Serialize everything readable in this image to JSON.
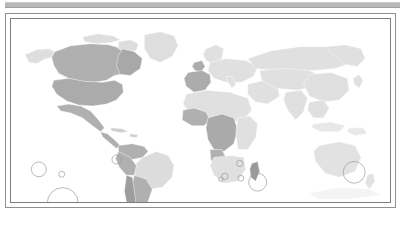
{
  "figure": {
    "type": "world-choropleth-map",
    "title": "",
    "topbar_color": "#b9b9b9",
    "frame_color": "#8f8f8f",
    "background": "#ffffff"
  },
  "legend": {
    "visible": false,
    "entries": []
  },
  "chart_data": {
    "type": "map",
    "title": "",
    "subtitle": "",
    "xlabel": "",
    "ylabel": "",
    "projection": "equirectangular",
    "grid": false,
    "legend_position": "none",
    "color_scale": {
      "no_data": "#f2f2f2",
      "low": "#e3e3e3",
      "medium": "#cfcfcf",
      "high": "#b3b3b3",
      "highest": "#9d9d9d"
    },
    "regions": [
      {
        "name": "Canada",
        "level": "high",
        "color": "#b0b0b0"
      },
      {
        "name": "United States",
        "level": "high",
        "color": "#ababab"
      },
      {
        "name": "Greenland",
        "level": "low",
        "color": "#dedede"
      },
      {
        "name": "Alaska",
        "level": "low",
        "color": "#dedede"
      },
      {
        "name": "Mexico",
        "level": "high",
        "color": "#b0b0b0"
      },
      {
        "name": "Guatemala",
        "level": "high",
        "color": "#b0b0b0"
      },
      {
        "name": "Honduras",
        "level": "high",
        "color": "#b0b0b0"
      },
      {
        "name": "Nicaragua",
        "level": "high",
        "color": "#b0b0b0"
      },
      {
        "name": "Costa Rica",
        "level": "high",
        "color": "#b0b0b0"
      },
      {
        "name": "Cuba",
        "level": "medium",
        "color": "#cfcfcf"
      },
      {
        "name": "Colombia",
        "level": "high",
        "color": "#b0b0b0"
      },
      {
        "name": "Venezuela",
        "level": "high",
        "color": "#b0b0b0"
      },
      {
        "name": "Peru",
        "level": "high",
        "color": "#b0b0b0"
      },
      {
        "name": "Bolivia",
        "level": "high",
        "color": "#b0b0b0"
      },
      {
        "name": "Brazil",
        "level": "low",
        "color": "#dcdcdc"
      },
      {
        "name": "Chile",
        "level": "highest",
        "color": "#9d9d9d"
      },
      {
        "name": "Argentina",
        "level": "high",
        "color": "#b0b0b0"
      },
      {
        "name": "United Kingdom",
        "level": "high",
        "color": "#acacac"
      },
      {
        "name": "Ireland",
        "level": "high",
        "color": "#acacac"
      },
      {
        "name": "France",
        "level": "high",
        "color": "#acacac"
      },
      {
        "name": "Spain",
        "level": "high",
        "color": "#acacac"
      },
      {
        "name": "Portugal",
        "level": "high",
        "color": "#acacac"
      },
      {
        "name": "Switzerland",
        "level": "high",
        "color": "#a8a8a8"
      },
      {
        "name": "Austria",
        "level": "high",
        "color": "#a8a8a8"
      },
      {
        "name": "Russia",
        "level": "low",
        "color": "#e0e0e0"
      },
      {
        "name": "China",
        "level": "low",
        "color": "#e0e0e0"
      },
      {
        "name": "India",
        "level": "low",
        "color": "#e0e0e0"
      },
      {
        "name": "Senegal",
        "level": "high",
        "color": "#b0b0b0"
      },
      {
        "name": "Guinea",
        "level": "high",
        "color": "#b0b0b0"
      },
      {
        "name": "Ghana",
        "level": "high",
        "color": "#b0b0b0"
      },
      {
        "name": "Nigeria",
        "level": "high",
        "color": "#aaaaaa"
      },
      {
        "name": "Cameroon",
        "level": "high",
        "color": "#aaaaaa"
      },
      {
        "name": "Gabon",
        "level": "high",
        "color": "#aaaaaa"
      },
      {
        "name": "DR Congo",
        "level": "high",
        "color": "#aaaaaa"
      },
      {
        "name": "Angola",
        "level": "high",
        "color": "#b0b0b0"
      },
      {
        "name": "Madagascar",
        "level": "highest",
        "color": "#9a9a9a"
      },
      {
        "name": "South Africa",
        "level": "low",
        "color": "#e0e0e0"
      },
      {
        "name": "Australia",
        "level": "low",
        "color": "#e2e2e2"
      },
      {
        "name": "New Zealand",
        "level": "low",
        "color": "#e2e2e2"
      }
    ],
    "bubbles": [
      {
        "label": "Pacific marker 1",
        "cx": 28,
        "cy": 152,
        "r": 7.5
      },
      {
        "label": "Pacific marker 2",
        "cx": 51,
        "cy": 157,
        "r": 3.0
      },
      {
        "label": "Pacific marker 3",
        "cx": 52,
        "cy": 186,
        "r": 15.5
      },
      {
        "label": "Caribbean marker",
        "cx": 106,
        "cy": 142,
        "r": 4.5
      },
      {
        "label": "Indian Ocean marker 1",
        "cx": 215,
        "cy": 159,
        "r": 3.2
      },
      {
        "label": "Indian Ocean marker 2",
        "cx": 230,
        "cy": 146,
        "r": 3.2
      },
      {
        "label": "Indian Ocean marker 3",
        "cx": 231,
        "cy": 161,
        "r": 3.0
      },
      {
        "label": "Indian Ocean marker 4",
        "cx": 211,
        "cy": 162,
        "r": 2.2
      },
      {
        "label": "Southern Ocean marker",
        "cx": 248,
        "cy": 165,
        "r": 9.0
      },
      {
        "label": "New Zealand marker",
        "cx": 345,
        "cy": 155,
        "r": 11.0
      }
    ]
  }
}
